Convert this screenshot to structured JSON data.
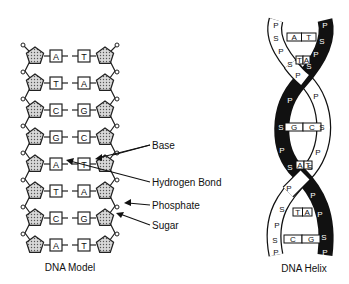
{
  "model": {
    "caption": "DNA Model",
    "pairs": [
      {
        "left": "A",
        "right": "T"
      },
      {
        "left": "T",
        "right": "A"
      },
      {
        "left": "C",
        "right": "G"
      },
      {
        "left": "G",
        "right": "C"
      },
      {
        "left": "A",
        "right": "T"
      },
      {
        "left": "T",
        "right": "A"
      },
      {
        "left": "C",
        "right": "G"
      },
      {
        "left": "A",
        "right": "T"
      }
    ],
    "labels": {
      "base": "Base",
      "hydrogen_bond": "Hydrogen Bond",
      "phosphate": "Phosphate",
      "sugar": "Sugar"
    }
  },
  "helix": {
    "caption": "DNA Helix",
    "pairs": [
      {
        "left": "A",
        "right": "T"
      },
      {
        "left": "T",
        "right": "A"
      },
      {
        "left": "G",
        "right": "C"
      },
      {
        "left": "A",
        "right": "T"
      },
      {
        "left": "T",
        "right": "A"
      },
      {
        "left": "C",
        "right": "G"
      }
    ],
    "phosphate_letter": "P",
    "sugar_letter": "S"
  }
}
